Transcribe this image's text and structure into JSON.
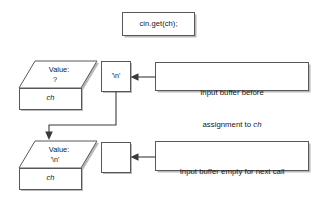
{
  "diagram": {
    "title_statement": "cin.get(ch);",
    "variable_before": {
      "value_label": "Value:",
      "value_content": "?",
      "name": "ch"
    },
    "variable_after": {
      "value_label": "Value:",
      "value_content": "'\\n'",
      "name": "ch"
    },
    "buffer_before": {
      "content": "'\\n'",
      "caption_line1": "Input buffer before",
      "caption_line2_prefix": "assignment to ",
      "caption_line2_var": "ch"
    },
    "buffer_after": {
      "content": "",
      "caption_line1": "Input buffer empty for next call",
      "caption_line2_prefix": "to cin.get(",
      "caption_line2_var": "ch",
      "caption_line2_suffix": ");"
    },
    "colors": {
      "stroke": "#58585a",
      "connector": "#3b3b3d",
      "shadow": "#b9b9bb",
      "background": "#ffffff",
      "text": "#161616"
    }
  }
}
